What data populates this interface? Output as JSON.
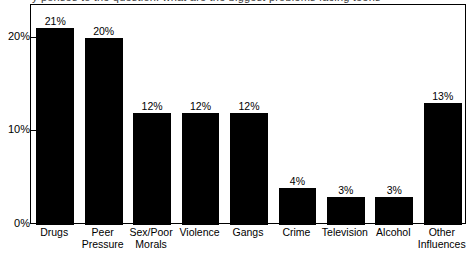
{
  "chart_data": {
    "type": "bar",
    "title": "",
    "xlabel": "",
    "ylabel": "",
    "ylim": [
      0,
      23.5
    ],
    "grid": false,
    "legend": null,
    "orientation": "vertical",
    "bar_color": "#000000",
    "background_color": "#ffffff",
    "value_label_suffix": "%",
    "categories": [
      "Drugs",
      "Peer Pressure",
      "Sex/Poor Morals",
      "Violence",
      "Gangs",
      "Crime",
      "Television",
      "Alcohol",
      "Other Influences"
    ],
    "category_lines": [
      [
        "Drugs"
      ],
      [
        "Peer",
        "Pressure"
      ],
      [
        "Sex/Poor",
        "Morals"
      ],
      [
        "Violence"
      ],
      [
        "Gangs"
      ],
      [
        "Crime"
      ],
      [
        "Television"
      ],
      [
        "Alcohol"
      ],
      [
        "Other",
        "Influences"
      ]
    ],
    "values": [
      21,
      20,
      12,
      12,
      12,
      4,
      3,
      3,
      13
    ],
    "value_labels": [
      "21%",
      "20%",
      "12%",
      "12%",
      "12%",
      "4%",
      "3%",
      "3%",
      "13%"
    ],
    "yticks": [
      0,
      10,
      20
    ],
    "ytick_labels": [
      "0%",
      "10%",
      "20%"
    ]
  },
  "figure": {
    "cutoff_title": "y   ponses to the question: what are the biggest problems facing teens"
  }
}
